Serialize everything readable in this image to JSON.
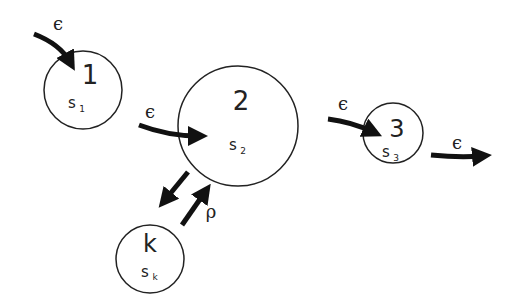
{
  "diagram": {
    "type": "state-transition network",
    "nodes": [
      {
        "id": "1",
        "label": "1",
        "state": "s",
        "subscript": "1"
      },
      {
        "id": "2",
        "label": "2",
        "state": "s",
        "subscript": "2"
      },
      {
        "id": "3",
        "label": "3",
        "state": "s",
        "subscript": "3"
      },
      {
        "id": "k",
        "label": "k",
        "state": "s",
        "subscript": "k"
      }
    ],
    "edges": [
      {
        "from": "external",
        "to": "1",
        "label": "ϵ"
      },
      {
        "from": "1",
        "to": "2",
        "label": "ϵ"
      },
      {
        "from": "2",
        "to": "3",
        "label": "ϵ"
      },
      {
        "from": "3",
        "to": "external",
        "label": "ϵ"
      },
      {
        "from": "2",
        "to": "k",
        "label": ""
      },
      {
        "from": "k",
        "to": "2",
        "label": "ρ"
      }
    ],
    "colors": {
      "stroke": "#222222",
      "arrow": "#111111",
      "background": "#ffffff"
    }
  }
}
